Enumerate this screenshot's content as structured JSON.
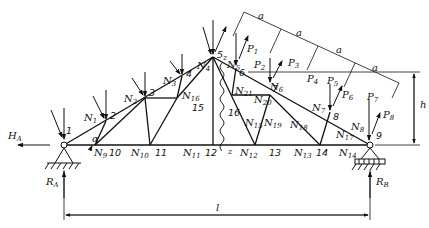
{
  "diagram": {
    "type": "roof truss with loads",
    "nodes": {
      "n1": "1",
      "n2": "2",
      "n3": "3",
      "n4": "4",
      "n5": "5",
      "n6": "6",
      "n7": "7",
      "n8": "8",
      "n9": "9",
      "n10": "10",
      "n11": "11",
      "n12": "12",
      "n13": "13",
      "n14": "14",
      "n15": "15",
      "n16": "16"
    },
    "members": {
      "N1": "N",
      "N1s": "1",
      "N2": "N",
      "N2s": "2",
      "N3": "N",
      "N3s": "3",
      "N4": "N",
      "N4s": "4",
      "N5": "N",
      "N5s": "5",
      "N6": "N",
      "N6s": "6",
      "N7": "N",
      "N7s": "7",
      "N8": "N",
      "N8s": "8",
      "N9": "N",
      "N9s": "9",
      "N10": "N",
      "N10s": "10",
      "N11": "N",
      "N11s": "11",
      "N12": "N",
      "N12s": "12",
      "N13": "N",
      "N13s": "13",
      "N14": "N",
      "N14s": "14",
      "N15": "N",
      "N15s": "15",
      "N16": "N",
      "N16s": "16",
      "N17": "N",
      "N17s": "17",
      "N18": "N",
      "N18s": "18",
      "N19": "N",
      "N19s": "19",
      "N20": "N",
      "N20s": "20",
      "N21": "N",
      "N21s": "21"
    },
    "loads": {
      "P1": "P",
      "P1s": "1",
      "P2": "P",
      "P2s": "2",
      "P3": "P",
      "P3s": "3",
      "P4": "P",
      "P4s": "4",
      "P5": "P",
      "P5s": "5",
      "P6": "P",
      "P6s": "6",
      "P7": "P",
      "P7s": "7",
      "P8": "P",
      "P8s": "8"
    },
    "reactions": {
      "HA": "H",
      "HAs": "A",
      "RA": "R",
      "RAs": "A",
      "RB": "R",
      "RBs": "B"
    },
    "dimensions": {
      "span": "l",
      "height": "h",
      "panel": "a",
      "angle": "α",
      "section": "z"
    }
  }
}
